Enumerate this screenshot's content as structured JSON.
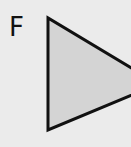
{
  "figure": {
    "label": "F",
    "shape": "triangle",
    "colors": {
      "background": "#ebebeb",
      "fill": "#d4d4d4",
      "stroke": "#111111"
    },
    "vertices": [
      [
        48,
        18
      ],
      [
        48,
        130
      ],
      [
        158,
        84
      ]
    ]
  }
}
